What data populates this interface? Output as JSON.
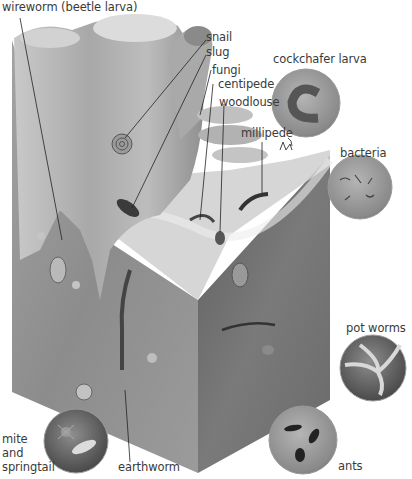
{
  "colors": {
    "background": "#ffffff",
    "label_text": "#3a3a3a",
    "leader_line": "#222222",
    "soil_left_face": "#8d8d8d",
    "soil_right_face": "#6a6a6a",
    "stump": "#b8b8b8",
    "circle_rim": "#9a9a9a"
  },
  "labels": {
    "wireworm": "wireworm (beetle larva)",
    "snail": "snail",
    "slug": "slug",
    "fungi": "fungi",
    "centipede": "centipede",
    "woodlouse": "woodlouse",
    "millipede": "millipede",
    "cockchafer_larva": "cockchafer larva",
    "bacteria": "bacteria",
    "pot_worms": "pot worms",
    "ants": "ants",
    "mite_line1": "mite",
    "mite_line2": "and",
    "mite_line3": "springtail",
    "earthworm": "earthworm"
  },
  "insets": [
    {
      "name": "cockchafer-larva",
      "cx": 306,
      "cy": 103,
      "r": 34
    },
    {
      "name": "bacteria",
      "cx": 360,
      "cy": 187,
      "r": 32
    },
    {
      "name": "pot-worms",
      "cx": 373,
      "cy": 368,
      "r": 33
    },
    {
      "name": "ants",
      "cx": 303,
      "cy": 440,
      "r": 34
    },
    {
      "name": "mite-and-springtail",
      "cx": 76,
      "cy": 441,
      "r": 32
    }
  ]
}
